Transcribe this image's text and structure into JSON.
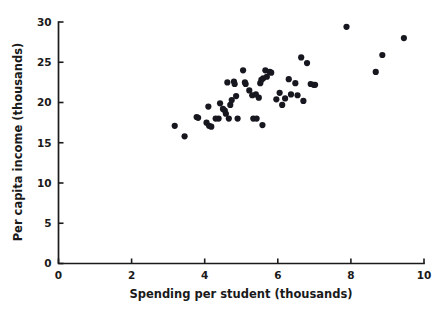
{
  "chart_data": {
    "type": "scatter",
    "title": "",
    "xlabel": "Spending per student (thousands)",
    "ylabel": "Per capita income (thousands)",
    "xlim": [
      0,
      10
    ],
    "ylim": [
      0,
      30
    ],
    "xticks": [
      0,
      2,
      4,
      6,
      8,
      10
    ],
    "yticks": [
      0,
      5,
      10,
      15,
      20,
      25,
      30
    ],
    "xtick_labels": [
      "0",
      "2",
      "4",
      "6",
      "8",
      "10"
    ],
    "ytick_labels": [
      "0",
      "5",
      "10",
      "15",
      "20",
      "25",
      "30"
    ],
    "grid": false,
    "legend": null,
    "marker_color": "#17171f",
    "marker_size": 3.1,
    "n_points": 57,
    "points": [
      [
        3.18,
        17.1
      ],
      [
        3.45,
        15.8
      ],
      [
        3.78,
        18.2
      ],
      [
        3.82,
        18.1
      ],
      [
        4.05,
        17.5
      ],
      [
        4.1,
        19.5
      ],
      [
        4.12,
        17.1
      ],
      [
        4.18,
        17.0
      ],
      [
        4.3,
        18.0
      ],
      [
        4.38,
        18.0
      ],
      [
        4.42,
        19.9
      ],
      [
        4.5,
        19.2
      ],
      [
        4.55,
        19.0
      ],
      [
        4.58,
        18.6
      ],
      [
        4.62,
        22.5
      ],
      [
        4.66,
        18.0
      ],
      [
        4.7,
        19.7
      ],
      [
        4.74,
        20.3
      ],
      [
        4.8,
        22.6
      ],
      [
        4.82,
        22.3
      ],
      [
        4.86,
        20.8
      ],
      [
        4.9,
        18.0
      ],
      [
        5.05,
        24.0
      ],
      [
        5.1,
        22.5
      ],
      [
        5.12,
        22.3
      ],
      [
        5.22,
        21.5
      ],
      [
        5.3,
        20.9
      ],
      [
        5.33,
        18.0
      ],
      [
        5.4,
        21.0
      ],
      [
        5.42,
        18.0
      ],
      [
        5.48,
        20.6
      ],
      [
        5.52,
        22.4
      ],
      [
        5.55,
        22.8
      ],
      [
        5.58,
        17.2
      ],
      [
        5.6,
        23.0
      ],
      [
        5.66,
        24.0
      ],
      [
        5.7,
        23.2
      ],
      [
        5.78,
        23.8
      ],
      [
        5.82,
        23.7
      ],
      [
        5.96,
        20.4
      ],
      [
        6.05,
        21.2
      ],
      [
        6.12,
        19.7
      ],
      [
        6.2,
        20.5
      ],
      [
        6.3,
        22.9
      ],
      [
        6.36,
        21.0
      ],
      [
        6.48,
        22.4
      ],
      [
        6.54,
        20.9
      ],
      [
        6.64,
        25.6
      ],
      [
        6.7,
        20.2
      ],
      [
        6.8,
        24.9
      ],
      [
        6.9,
        22.3
      ],
      [
        6.98,
        22.2
      ],
      [
        7.02,
        22.2
      ],
      [
        7.88,
        29.4
      ],
      [
        8.68,
        23.8
      ],
      [
        8.86,
        25.9
      ],
      [
        9.45,
        28.0
      ]
    ]
  },
  "axes": {
    "x_title": "Spending per student (thousands)",
    "y_title": "Per capita income (thousands)"
  }
}
